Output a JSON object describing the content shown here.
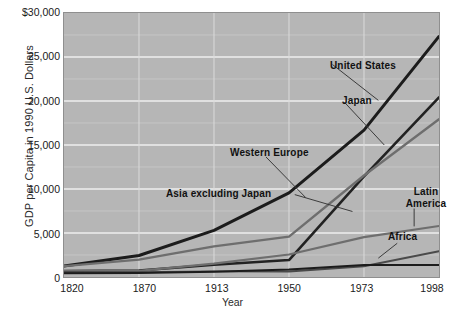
{
  "chart_data": {
    "type": "line",
    "title": "",
    "xlabel": "Year",
    "ylabel": "GDP per Capita in 1990 U.S. Dollars",
    "categories": [
      "1820",
      "1870",
      "1913",
      "1950",
      "1973",
      "1998"
    ],
    "ylim": [
      0,
      30000
    ],
    "yticks": [
      0,
      5000,
      10000,
      15000,
      20000,
      25000,
      30000
    ],
    "ytick_labels": [
      "0",
      "5,000",
      "10,000",
      "15,000",
      "20,000",
      "25,000",
      "$30,000"
    ],
    "grid": true,
    "minor_grid_step": 2500,
    "legend_position": "inline-annotations",
    "series": [
      {
        "name": "United States",
        "color": "#1c1c1c",
        "width": 3.0,
        "values": [
          1257,
          2445,
          5301,
          9561,
          16689,
          27331
        ]
      },
      {
        "name": "Japan",
        "color": "#222222",
        "width": 2.6,
        "values": [
          669,
          737,
          1387,
          1926,
          11439,
          20413
        ]
      },
      {
        "name": "Western Europe",
        "color": "#6e6e6e",
        "width": 2.4,
        "values": [
          1232,
          1974,
          3473,
          4594,
          11534,
          17921
        ]
      },
      {
        "name": "Latin America",
        "color": "#6e6e6e",
        "width": 2.2,
        "values": [
          665,
          698,
          1511,
          2554,
          4531,
          5795
        ]
      },
      {
        "name": "Asia excluding Japan",
        "color": "#4a4a4a",
        "width": 2.0,
        "values": [
          575,
          543,
          640,
          635,
          1231,
          2936
        ]
      },
      {
        "name": "Africa",
        "color": "#1c1c1c",
        "width": 2.0,
        "values": [
          418,
          444,
          585,
          852,
          1365,
          1368
        ]
      }
    ],
    "annotations": [
      {
        "label": "United States",
        "name": "annotation-united-states"
      },
      {
        "label": "Japan",
        "name": "annotation-japan"
      },
      {
        "label": "Western Europe",
        "name": "annotation-western-europe"
      },
      {
        "label": "Asia excluding Japan",
        "name": "annotation-asia-excluding-japan"
      },
      {
        "label": "Latin America",
        "name": "annotation-latin-america"
      },
      {
        "label": "Africa",
        "name": "annotation-africa"
      }
    ]
  }
}
